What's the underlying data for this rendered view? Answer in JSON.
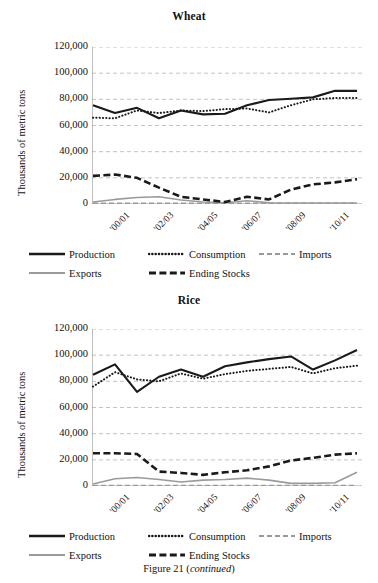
{
  "caption": {
    "text": "Figure 21 (",
    "emphasis": "continued",
    "text_end": ")"
  },
  "legend": {
    "items": [
      {
        "label": "Production",
        "style": "solid-thick-black",
        "color": "#1a1a1a"
      },
      {
        "label": "Consumption",
        "style": "dotted-black",
        "color": "#1a1a1a"
      },
      {
        "label": "Imports",
        "style": "dashed-gray",
        "color": "#9a9a9a"
      },
      {
        "label": "Exports",
        "style": "solid-gray",
        "color": "#9a9a9a"
      },
      {
        "label": "Ending Stocks",
        "style": "dashed-thick-black",
        "color": "#1a1a1a"
      }
    ]
  },
  "axis": {
    "ylabel": "Thousands of metric tons",
    "yticks": [
      "0",
      "20,000",
      "40,000",
      "60,000",
      "80,000",
      "100,000",
      "120,000"
    ],
    "xticks": [
      "'00/01",
      "'02/03",
      "'04/05",
      "'06/07",
      "'08/09",
      "'10/11"
    ]
  },
  "chart_data": [
    {
      "type": "line",
      "title": "Wheat",
      "xlabel": "",
      "ylabel": "Thousands of metric tons",
      "ylim": [
        0,
        120000
      ],
      "ytick_values": [
        0,
        20000,
        40000,
        60000,
        80000,
        100000,
        120000
      ],
      "grid": true,
      "legend_position": "bottom",
      "x": [
        "'00/01",
        "'01/02",
        "'02/03",
        "'03/04",
        "'04/05",
        "'05/06",
        "'06/07",
        "'07/08",
        "'08/09",
        "'09/10",
        "'10/11",
        "'11/12",
        "'12/13"
      ],
      "xtick_labels": [
        "'00/01",
        "",
        "'02/03",
        "",
        "'04/05",
        "",
        "'06/07",
        "",
        "'08/09",
        "",
        "'10/11",
        "",
        ""
      ],
      "series": [
        {
          "name": "Production",
          "values": [
            75500,
            69500,
            73500,
            65500,
            71500,
            68500,
            69000,
            75500,
            79500,
            80500,
            81500,
            86500,
            86500
          ]
        },
        {
          "name": "Consumption",
          "values": [
            66000,
            65500,
            71500,
            69500,
            71500,
            71000,
            72500,
            73000,
            70000,
            75500,
            80000,
            81000,
            81000
          ]
        },
        {
          "name": "Imports",
          "values": [
            500,
            500,
            500,
            500,
            500,
            500,
            500,
            500,
            500,
            500,
            500,
            500,
            500
          ]
        },
        {
          "name": "Exports",
          "values": [
            1500,
            3500,
            5000,
            5500,
            3000,
            1500,
            1000,
            2500,
            1000,
            800,
            800,
            800,
            800
          ]
        },
        {
          "name": "Ending Stocks",
          "values": [
            21500,
            22500,
            20000,
            12500,
            5500,
            3500,
            1500,
            5500,
            3500,
            11000,
            15000,
            16500,
            19000
          ]
        }
      ]
    },
    {
      "type": "line",
      "title": "Rice",
      "xlabel": "",
      "ylabel": "Thousands of metric tons",
      "ylim": [
        0,
        120000
      ],
      "ytick_values": [
        0,
        20000,
        40000,
        60000,
        80000,
        100000,
        120000
      ],
      "grid": true,
      "legend_position": "bottom",
      "x": [
        "'00/01",
        "'01/02",
        "'02/03",
        "'03/04",
        "'04/05",
        "'05/06",
        "'06/07",
        "'07/08",
        "'08/09",
        "'09/10",
        "'10/11",
        "'11/12",
        "'12/13"
      ],
      "xtick_labels": [
        "'00/01",
        "",
        "'02/03",
        "",
        "'04/05",
        "",
        "'06/07",
        "",
        "'08/09",
        "",
        "'10/11",
        "",
        ""
      ],
      "series": [
        {
          "name": "Production",
          "values": [
            85000,
            93000,
            72000,
            83500,
            89000,
            83500,
            91500,
            94500,
            97000,
            99000,
            89000,
            96000,
            104000
          ]
        },
        {
          "name": "Consumption",
          "values": [
            76000,
            87000,
            81500,
            80000,
            86000,
            82000,
            85500,
            88000,
            89500,
            91000,
            86000,
            90000,
            92000
          ]
        },
        {
          "name": "Imports",
          "values": [
            400,
            400,
            400,
            400,
            400,
            400,
            400,
            400,
            400,
            400,
            400,
            400,
            400
          ]
        },
        {
          "name": "Exports",
          "values": [
            1500,
            5500,
            6500,
            5000,
            3000,
            4500,
            5000,
            6000,
            4500,
            2000,
            2000,
            2500,
            10500
          ]
        },
        {
          "name": "Ending Stocks",
          "values": [
            25000,
            25000,
            24500,
            11000,
            10000,
            8500,
            10500,
            12000,
            15000,
            19500,
            21500,
            24000,
            25000
          ]
        }
      ]
    }
  ]
}
